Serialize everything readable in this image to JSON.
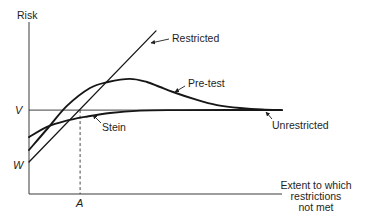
{
  "chart_data": {
    "type": "line",
    "title": "",
    "ylabel": "Risk",
    "xlabel": [
      "Extent to which",
      "restrictions",
      "not met"
    ],
    "xlim": [
      0,
      100
    ],
    "ylim": [
      0,
      100
    ],
    "grid": false,
    "legend": "none (curves labelled directly with arrows)",
    "reference_levels": {
      "V": {
        "label": "V",
        "axis": "y",
        "value": 48.8
      },
      "W": {
        "label": "W",
        "axis": "y",
        "value": 18.6
      },
      "A": {
        "label": "A",
        "axis": "x",
        "value": 20.2
      }
    },
    "series": [
      {
        "name": "Restricted",
        "style": "straight",
        "points": [
          [
            0,
            18.6
          ],
          [
            50.2,
            94.8
          ]
        ]
      },
      {
        "name": "Pre-test",
        "style": "smooth",
        "points": [
          [
            0,
            25.6
          ],
          [
            7.5,
            38.4
          ],
          [
            15.0,
            51.2
          ],
          [
            24.1,
            61.6
          ],
          [
            31.2,
            65.1
          ],
          [
            39.9,
            66.9
          ],
          [
            46.6,
            65.1
          ],
          [
            51.8,
            62.2
          ],
          [
            56.9,
            59.3
          ],
          [
            66.4,
            54.7
          ],
          [
            74.3,
            51.7
          ],
          [
            83.4,
            50.0
          ],
          [
            92.1,
            49.1
          ],
          [
            100,
            48.8
          ]
        ]
      },
      {
        "name": "Stein",
        "style": "smooth",
        "points": [
          [
            0,
            33.1
          ],
          [
            7.1,
            39.0
          ],
          [
            14.2,
            42.4
          ],
          [
            22.1,
            44.8
          ],
          [
            32.0,
            47.1
          ],
          [
            43.9,
            48.5
          ],
          [
            59.7,
            48.8
          ],
          [
            100,
            48.8
          ]
        ]
      },
      {
        "name": "Unrestricted",
        "style": "straight",
        "points": [
          [
            0,
            48.8
          ],
          [
            100,
            48.8
          ]
        ]
      }
    ],
    "annotations": [
      {
        "text": "Restricted",
        "points_to": "Restricted line near top"
      },
      {
        "text": "Pre-test",
        "points_to": "Pre-test curve descending side"
      },
      {
        "text": "Stein",
        "points_to": "Stein curve below V"
      },
      {
        "text": "Unrestricted",
        "points_to": "Horizontal line at V"
      }
    ]
  },
  "labels": {
    "y_axis": "Risk",
    "x_axis_line1": "Extent to which",
    "x_axis_line2": "restrictions",
    "x_axis_line3": "not met",
    "v": "V",
    "w": "W",
    "a": "A",
    "restricted": "Restricted",
    "pretest": "Pre-test",
    "stein": "Stein",
    "unrestricted": "Unrestricted"
  }
}
